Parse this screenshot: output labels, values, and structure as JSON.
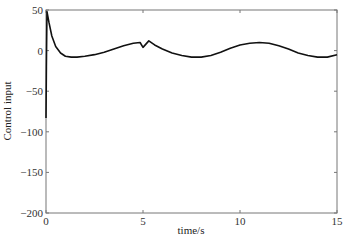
{
  "chart_data": {
    "type": "line",
    "title": "",
    "xlabel": "time/s",
    "ylabel": "Control input",
    "xlim": [
      0,
      15
    ],
    "ylim": [
      -200,
      50
    ],
    "grid": false,
    "legend": null,
    "x_ticks": [
      0,
      5,
      10,
      15
    ],
    "y_ticks": [
      50,
      0,
      -50,
      -100,
      -150,
      -200
    ],
    "x_tick_labels": [
      "0",
      "5",
      "10",
      "15"
    ],
    "y_tick_labels": [
      "50",
      "0",
      "−50",
      "−100",
      "−150",
      "−200"
    ],
    "series": [
      {
        "name": "control input",
        "color": "#111111",
        "x": [
          0,
          0.02,
          0.05,
          0.15,
          0.3,
          0.5,
          0.75,
          1.0,
          1.3,
          1.6,
          2.0,
          2.5,
          3.0,
          3.5,
          4.0,
          4.5,
          4.85,
          5.0,
          5.15,
          5.3,
          5.6,
          6.0,
          6.5,
          7.0,
          7.5,
          8.0,
          8.5,
          9.0,
          9.5,
          10.0,
          10.5,
          11.0,
          11.5,
          12.0,
          12.5,
          13.0,
          13.5,
          14.0,
          14.5,
          15.0
        ],
        "y": [
          -83,
          -20,
          48,
          35,
          18,
          5,
          -3,
          -7,
          -8,
          -8,
          -7,
          -5,
          -2,
          2,
          6,
          9,
          10,
          4,
          8,
          12,
          7,
          2,
          -3,
          -6,
          -8,
          -8,
          -6,
          -2,
          3,
          7,
          9,
          10,
          9,
          6,
          2,
          -3,
          -6,
          -8,
          -8,
          -5
        ]
      }
    ]
  }
}
